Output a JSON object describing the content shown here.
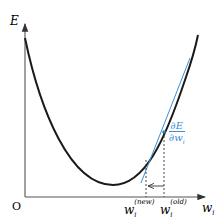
{
  "diagram": {
    "y_axis_label": "E",
    "x_axis_label": "w",
    "x_axis_subscript": "i",
    "origin_label": "O",
    "w_new": {
      "base": "w",
      "sub": "i",
      "sup": "(new)"
    },
    "w_old": {
      "base": "w",
      "sub": "i",
      "sup": "(old)"
    },
    "gradient_label": {
      "numerator": "∂E",
      "denominator": "∂w",
      "denominator_sub": "i"
    },
    "colors": {
      "curve": "#1a1a1a",
      "axis": "#555555",
      "tangent": "#3a8fd6",
      "gradient_text": "#3a8fd6"
    }
  }
}
